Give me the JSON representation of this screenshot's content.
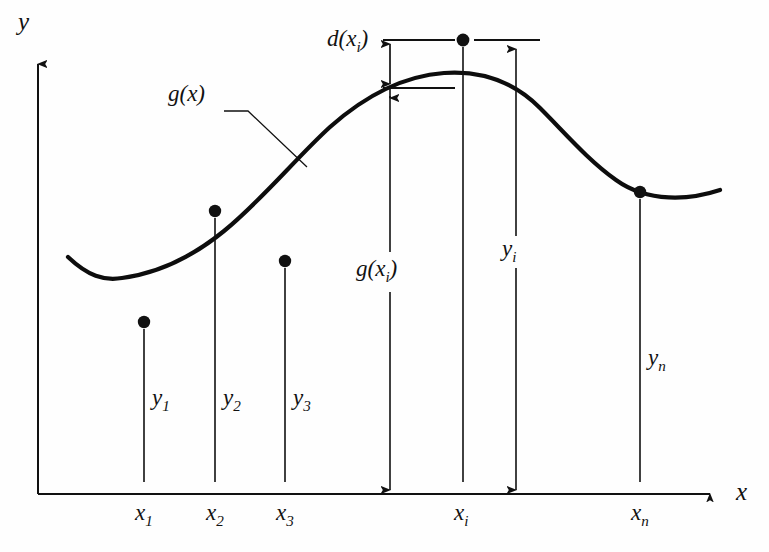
{
  "figure": {
    "kind": "least-squares-regression-diagram"
  },
  "axes": {
    "y_label": "y",
    "x_label": "x",
    "origin": {
      "x": 38,
      "y": 494
    },
    "x_axis_tip": {
      "x": 722,
      "y": 494
    },
    "y_axis_tip": {
      "x": 38,
      "y": 52
    }
  },
  "curve": {
    "label": "g(x)",
    "label_pos": {
      "x": 168,
      "y": 99
    },
    "leader": {
      "from": {
        "x": 224,
        "y": 111
      },
      "bend": {
        "x": 248,
        "y": 111
      },
      "to": {
        "x": 307,
        "y": 167
      }
    },
    "path": "M 68 257 C 88 276 104 281 122 278 C 152 274 186 262 224 231 C 262 200 296 158 330 127 C 366 95 404 76 444 73 C 486 70 516 84 540 108 C 566 134 588 160 616 180 C 648 203 690 200 720 190"
  },
  "annotation": {
    "deviation_label": "d(x_i)",
    "deviation_label_pos": {
      "x": 327,
      "y": 43
    },
    "upper_tick": {
      "y": 40,
      "x1": 383,
      "x2": 455
    },
    "upper_tick_right": {
      "y": 40,
      "x1": 474,
      "x2": 540
    },
    "lower_tick": {
      "y": 88,
      "x1": 383,
      "x2": 455
    }
  },
  "points": [
    {
      "name": "x1",
      "x_label": "x",
      "x_sub": "1",
      "y_label": "y",
      "y_sub": "1",
      "dot": {
        "x": 144,
        "y": 322
      },
      "line_top": 329,
      "line_bottom": 482,
      "x_label_pos": {
        "x": 135,
        "y": 500
      },
      "y_label_pos": {
        "x": 152,
        "y": 385
      }
    },
    {
      "name": "x2",
      "x_label": "x",
      "x_sub": "2",
      "y_label": "y",
      "y_sub": "2",
      "dot": {
        "x": 215,
        "y": 211
      },
      "line_top": 218,
      "line_bottom": 482,
      "x_label_pos": {
        "x": 206,
        "y": 500
      },
      "y_label_pos": {
        "x": 223,
        "y": 385
      }
    },
    {
      "name": "x3",
      "x_label": "x",
      "x_sub": "3",
      "y_label": "y",
      "y_sub": "3",
      "dot": {
        "x": 285,
        "y": 261
      },
      "line_top": 268,
      "line_bottom": 482,
      "x_label_pos": {
        "x": 276,
        "y": 500
      },
      "y_label_pos": {
        "x": 293,
        "y": 385
      }
    },
    {
      "name": "xn",
      "x_label": "x",
      "x_sub": "n",
      "y_label": "y",
      "y_sub": "n",
      "dot": {
        "x": 640,
        "y": 192
      },
      "line_top": 199,
      "line_bottom": 482,
      "x_label_pos": {
        "x": 631,
        "y": 500
      },
      "y_label_pos": {
        "x": 648,
        "y": 345
      }
    }
  ],
  "xi": {
    "x_label": "x",
    "x_sub": "i",
    "x_label_pos": {
      "x": 454,
      "y": 500
    },
    "dot": {
      "x": 463,
      "y": 40
    },
    "point_line": {
      "x": 463,
      "top": 47,
      "bottom": 482
    },
    "g_arrow": {
      "x": 390,
      "top": 88,
      "bottom": 490
    },
    "g_label": "g(x_i)",
    "g_label_pos": {
      "x": 356,
      "y": 272
    },
    "g_gap": {
      "top": 252,
      "bottom": 292
    },
    "y_arrow": {
      "x": 516,
      "top": 40,
      "bottom": 490
    },
    "y_label": "y_i",
    "y_label_pos": {
      "x": 502,
      "y": 252
    },
    "y_gap": {
      "top": 236,
      "bottom": 268
    }
  },
  "colors": {
    "ink": "#111111",
    "curve": "#0d0d0d",
    "background": "#fefefe"
  }
}
